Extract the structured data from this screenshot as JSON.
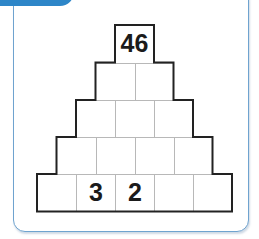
{
  "header": {
    "tab_color": "#2d86c8"
  },
  "pyramid": {
    "rows": [
      {
        "cells": [
          "46"
        ]
      },
      {
        "cells": [
          "",
          ""
        ]
      },
      {
        "cells": [
          "",
          "",
          ""
        ]
      },
      {
        "cells": [
          "",
          "",
          "",
          ""
        ]
      },
      {
        "cells": [
          "",
          "3",
          "2",
          "",
          ""
        ]
      }
    ]
  },
  "colors": {
    "frame_border": "#6fa3cf",
    "cell_outline": "#222222",
    "cell_divider": "#b8b8b8"
  }
}
